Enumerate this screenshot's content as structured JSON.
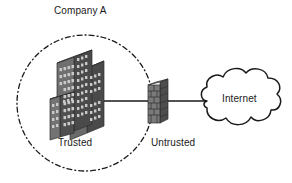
{
  "diagram": {
    "background_color": "#ffffff",
    "labels": {
      "company": "Company A",
      "trusted": "Trusted",
      "untrusted": "Untrusted",
      "internet": "Internet"
    },
    "zones": [
      {
        "name": "trusted-zone",
        "label": "Trusted",
        "boundary_style": "dash-dot-circle",
        "boundary_color": "#1a1a1a",
        "owner": "Company A"
      },
      {
        "name": "untrusted-zone",
        "label": "Untrusted",
        "boundary_style": "none"
      }
    ],
    "nodes": [
      {
        "name": "corporate-buildings-icon",
        "label": "Trusted",
        "type": "buildings",
        "color": "#5a5a5a",
        "zone": "trusted-zone"
      },
      {
        "name": "firewall-icon",
        "label": "Untrusted",
        "type": "firewall-brick-wall",
        "color": "#6e6e6e",
        "zone": "boundary"
      },
      {
        "name": "internet-cloud-icon",
        "label": "Internet",
        "type": "cloud",
        "color": "#1a1a1a",
        "zone": "untrusted-zone"
      }
    ],
    "links": [
      {
        "name": "buildings-to-firewall-link",
        "from": "corporate-buildings-icon",
        "to": "firewall-icon",
        "style": "solid"
      },
      {
        "name": "firewall-to-internet-link",
        "from": "firewall-icon",
        "to": "internet-cloud-icon",
        "style": "solid"
      }
    ]
  }
}
